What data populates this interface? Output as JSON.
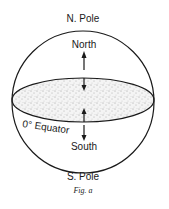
{
  "figure": {
    "top_label": "N. Pole",
    "bottom_label": "S. Pole",
    "north_label": "North",
    "south_label": "South",
    "equator_label": "0° Equator",
    "caption": "Fig. a"
  },
  "colors": {
    "stroke": "#1a1a1a",
    "stipple": "#555555",
    "background": "#ffffff"
  }
}
